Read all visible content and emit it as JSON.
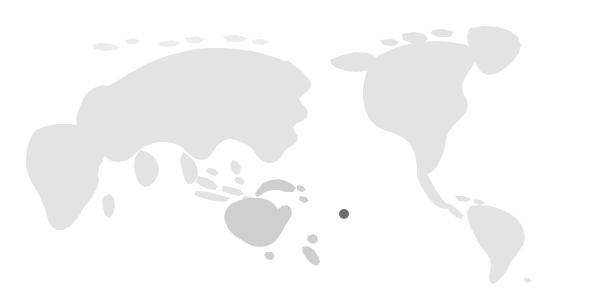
{
  "map": {
    "title": "World map",
    "projection": "equirectangular-pacific-centered",
    "center_longitude": 150,
    "background_color": "#ffffff",
    "land_color": "#e3e3e3",
    "land_color_highlight": "#cfcfcf",
    "land_color_faint": "#ededed",
    "marker_color": "#6e6e6e",
    "width": 605,
    "height": 293,
    "regions": [
      {
        "name": "eurasia",
        "label": "Eurasia",
        "shade": "land_color"
      },
      {
        "name": "africa",
        "label": "Africa",
        "shade": "land_color"
      },
      {
        "name": "north-america",
        "label": "North America",
        "shade": "land_color"
      },
      {
        "name": "south-america",
        "label": "South America",
        "shade": "land_color"
      },
      {
        "name": "greenland",
        "label": "Greenland",
        "shade": "land_color"
      },
      {
        "name": "australia",
        "label": "Australia",
        "shade": "land_color_highlight"
      },
      {
        "name": "new-guinea",
        "label": "New Guinea",
        "shade": "land_color_highlight"
      },
      {
        "name": "new-zealand",
        "label": "New Zealand",
        "shade": "land_color_highlight"
      },
      {
        "name": "japan",
        "label": "Japan",
        "shade": "land_color"
      },
      {
        "name": "indonesia",
        "label": "Indonesia",
        "shade": "land_color"
      },
      {
        "name": "madagascar",
        "label": "Madagascar",
        "shade": "land_color"
      },
      {
        "name": "arctic-islands",
        "label": "Arctic islands",
        "shade": "land_color_faint"
      }
    ],
    "markers": [
      {
        "name": "location-marker",
        "label": "Fiji",
        "x": 344,
        "y": 214,
        "radius": 5,
        "color": "#6e6e6e"
      }
    ]
  }
}
